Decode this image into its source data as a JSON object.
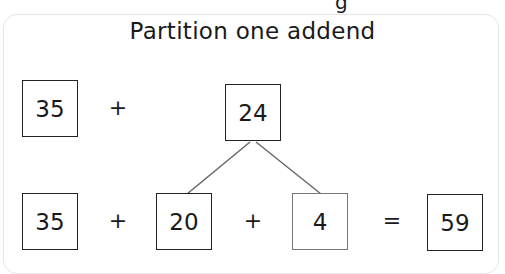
{
  "title": "Partition one addend",
  "partial_top_text": "g",
  "row1": {
    "addend_a": "35",
    "operator": "+",
    "addend_b": "24"
  },
  "row2": {
    "addend_a": "35",
    "op1": "+",
    "part_tens": "20",
    "op2": "+",
    "part_ones": "4",
    "equals": "=",
    "sum": "59"
  },
  "colors": {
    "box_border": "#222222",
    "line": "#666666",
    "card_border": "#e6e6e6"
  }
}
